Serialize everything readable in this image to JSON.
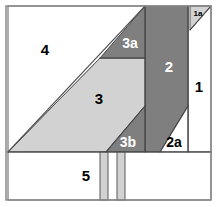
{
  "diagram": {
    "canvas": {
      "width": 218,
      "height": 207
    },
    "colors": {
      "background": "#ffffff",
      "light_gray": "#d2d2d2",
      "mid_gray": "#c9c9c9",
      "dark_gray": "#7f7f7f",
      "border": "#8a8a8a",
      "line": "#4a4a4a",
      "label_dark": "#000000",
      "label_light": "#ffffff"
    },
    "border": {
      "x": 6,
      "y": 6,
      "width": 205,
      "height": 194,
      "stroke_width": 1.5
    },
    "sections": [
      {
        "id": "1",
        "label": "1",
        "fill": "#ffffff",
        "label_color": "#000000",
        "label_x": 199,
        "label_y": 88,
        "font_size": 15,
        "points": "188,6 211,6 211,152 188,152"
      },
      {
        "id": "1a",
        "label": "1a",
        "fill": "#d2d2d2",
        "label_color": "#000000",
        "label_x": 198,
        "label_y": 14,
        "font_size": 8,
        "points": "190,6 211,6 190,30"
      },
      {
        "id": "2",
        "label": "2",
        "fill": "#7f7f7f",
        "label_color": "#ffffff",
        "label_x": 169,
        "label_y": 68,
        "font_size": 15,
        "points": "145,6 188,6 188,106 160,152 145,152"
      },
      {
        "id": "2a",
        "label": "2a",
        "fill": "#ffffff",
        "label_color": "#000000",
        "label_x": 174,
        "label_y": 143,
        "font_size": 14,
        "points": "188,106 188,152 160,152"
      },
      {
        "id": "3",
        "label": "3",
        "fill": "#d2d2d2",
        "label_color": "#000000",
        "label_x": 99,
        "label_y": 100,
        "font_size": 15,
        "points": "8,152 100,58 145,58 145,106 106,152"
      },
      {
        "id": "3a",
        "label": "3a",
        "fill": "#7f7f7f",
        "label_color": "#ffffff",
        "label_x": 130,
        "label_y": 44,
        "font_size": 14,
        "points": "100,58 145,6 145,58"
      },
      {
        "id": "3b",
        "label": "3b",
        "fill": "#7f7f7f",
        "label_color": "#ffffff",
        "label_x": 128,
        "label_y": 143,
        "font_size": 14,
        "points": "145,106 145,152 106,152"
      },
      {
        "id": "4",
        "label": "4",
        "fill": "#ffffff",
        "label_color": "#000000",
        "label_x": 45,
        "label_y": 51,
        "font_size": 15,
        "points": "8,6 145,6 100,58 8,152"
      },
      {
        "id": "5",
        "label": "5",
        "fill": "#ffffff",
        "label_color": "#000000",
        "label_x": 86,
        "label_y": 177,
        "font_size": 15,
        "points": "8,152 211,152 211,200 8,200"
      }
    ],
    "strips": [
      {
        "id": "strip-left",
        "x": 100,
        "y": 152,
        "width": 8,
        "height": 48,
        "fill": "#d2d2d2"
      },
      {
        "id": "strip-right",
        "x": 117,
        "y": 152,
        "width": 8,
        "height": 48,
        "fill": "#d2d2d2"
      }
    ],
    "seam_lines": [
      {
        "id": "seam-top-diagonal",
        "x1": 8,
        "y1": 152,
        "x2": 145,
        "y2": 6
      },
      {
        "id": "seam-3a-bottom",
        "x1": 100,
        "y1": 58,
        "x2": 145,
        "y2": 58
      },
      {
        "id": "seam-2-left",
        "x1": 145,
        "y1": 6,
        "x2": 145,
        "y2": 152
      },
      {
        "id": "seam-2-diagonal",
        "x1": 188,
        "y1": 106,
        "x2": 160,
        "y2": 152
      },
      {
        "id": "seam-3b-diagonal",
        "x1": 145,
        "y1": 106,
        "x2": 106,
        "y2": 152
      },
      {
        "id": "seam-1-left",
        "x1": 188,
        "y1": 6,
        "x2": 188,
        "y2": 152
      },
      {
        "id": "seam-1a-diagonal",
        "x1": 190,
        "y1": 30,
        "x2": 211,
        "y2": 6
      },
      {
        "id": "seam-5-top",
        "x1": 8,
        "y1": 152,
        "x2": 211,
        "y2": 152
      }
    ]
  }
}
